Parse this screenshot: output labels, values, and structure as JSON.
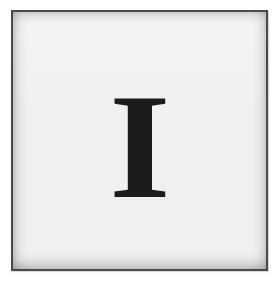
{
  "tile": {
    "letter": "I",
    "letter_color": "#1c1c1c",
    "background_color": "#f0f0f0",
    "border_color": "#4a4a4a"
  }
}
